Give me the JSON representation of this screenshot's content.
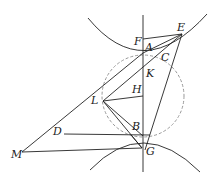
{
  "diagram": {
    "points": {
      "A": "A",
      "B": "B",
      "C": "C",
      "D": "D",
      "E": "E",
      "F": "F",
      "G": "G",
      "H": "H",
      "K": "K",
      "L": "L",
      "M": "M"
    },
    "colors": {
      "line": "#222222",
      "circle": "#999999",
      "background": "#ffffff"
    }
  }
}
